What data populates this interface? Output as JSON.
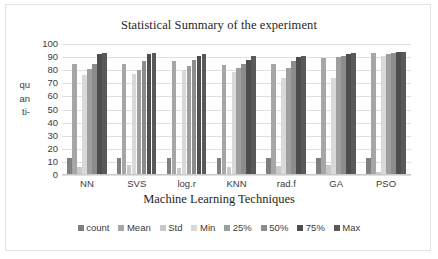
{
  "chart_data": {
    "type": "bar",
    "title": "Statistical Summary of the experiment",
    "xlabel": "Machine Learning Techniques",
    "ylabel": "qu an ti-",
    "ylabel_lines": [
      "qu",
      "an",
      "ti-"
    ],
    "ylim": [
      0,
      100
    ],
    "ytick_step": 10,
    "yticks": [
      100,
      90,
      80,
      70,
      60,
      50,
      40,
      30,
      20,
      10,
      0
    ],
    "grid": true,
    "legend_position": "bottom",
    "categories": [
      "NN",
      "SVS",
      "log.r",
      "KNN",
      "rad.f",
      "GA",
      "PSO"
    ],
    "series": [
      {
        "name": "count",
        "color": "#7f7f7f",
        "values": [
          13,
          13,
          13,
          13,
          13,
          13,
          13
        ]
      },
      {
        "name": "Mean",
        "color": "#a6a6a6",
        "values": [
          85,
          85,
          87,
          84,
          85,
          89,
          93
        ]
      },
      {
        "name": "Std",
        "color": "#c9c9c9",
        "values": [
          6,
          8,
          5,
          6,
          7,
          8,
          2
        ]
      },
      {
        "name": "Min",
        "color": "#d9d9d9",
        "values": [
          76,
          77,
          80,
          79,
          74,
          74,
          91
        ]
      },
      {
        "name": "25%",
        "color": "#9e9e9e",
        "values": [
          81,
          80,
          83,
          82,
          82,
          90,
          92
        ]
      },
      {
        "name": "50%",
        "color": "#8c8c8c",
        "values": [
          85,
          87,
          88,
          85,
          87,
          91,
          93
        ]
      },
      {
        "name": "75%",
        "color": "#4d4d4d",
        "values": [
          92,
          92,
          91,
          88,
          90,
          92,
          94
        ]
      },
      {
        "name": "Max",
        "color": "#595959",
        "values": [
          93,
          93,
          92,
          91,
          91,
          93,
          94
        ]
      }
    ]
  }
}
